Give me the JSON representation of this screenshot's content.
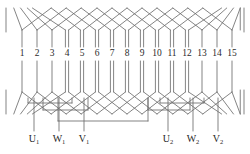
{
  "diagram": {
    "slot_count": 15,
    "slot_numbers": [
      "1",
      "2",
      "3",
      "4",
      "5",
      "6",
      "7",
      "8",
      "9",
      "10",
      "11",
      "12",
      "13",
      "14",
      "15"
    ],
    "line_color": "#6e6e6e",
    "line_color_dark": "#4a4a4a",
    "text_color": "#2b2b2b",
    "background_color": "#ffffff",
    "watermark_color": "#ededed"
  },
  "terminals": {
    "left": [
      {
        "id": "U1",
        "base": "U",
        "sub": "1",
        "x": 34,
        "slot": 1
      },
      {
        "id": "W1",
        "base": "W",
        "sub": "1",
        "x": 59,
        "slot": 3
      },
      {
        "id": "V1",
        "base": "V",
        "sub": "1",
        "x": 84,
        "slot": 5
      }
    ],
    "right": [
      {
        "id": "U2",
        "base": "U",
        "sub": "2",
        "x": 168,
        "slot": 11
      },
      {
        "id": "W2",
        "base": "W",
        "sub": "2",
        "x": 193,
        "slot": 13
      },
      {
        "id": "V2",
        "base": "V",
        "sub": "2",
        "x": 218,
        "slot": 15
      }
    ]
  },
  "geometry": {
    "slot_x": [
      22,
      37,
      52,
      67,
      82,
      97,
      112,
      127,
      142,
      157,
      172,
      187,
      202,
      217,
      232
    ],
    "slot_label_y": 54,
    "bar_top_y": 30,
    "bar_bottom_y": 92,
    "label_gap_top": 47,
    "label_gap_bottom": 61,
    "end_top_peak_y": 8,
    "end_bottom_peak_y": 114,
    "lead_label_y": 140,
    "double_layer_from_slot": 4,
    "double_layer_to_slot": 12,
    "bar_offset": 1.6
  },
  "jumpers": {
    "left_group": [
      {
        "name": "jumper-u-phase",
        "y": 103,
        "x1": 28,
        "x2": 72
      },
      {
        "name": "jumper-w-phase",
        "y": 110,
        "x1": 43,
        "x2": 88
      },
      {
        "name": "jumper-v-phase",
        "y": 121,
        "x1": 58,
        "x2": 148
      }
    ],
    "right_group": [
      {
        "name": "jumper-u2-phase",
        "y": 103,
        "x1": 160,
        "x2": 204
      },
      {
        "name": "jumper-w2-phase",
        "y": 110,
        "x1": 148,
        "x2": 190
      }
    ]
  },
  "watermark": {
    "lines": [
      {
        "text": "",
        "x": 205,
        "y": 14
      },
      {
        "text": "",
        "x": 200,
        "y": 30
      },
      {
        "text": "",
        "x": 210,
        "y": 48
      }
    ]
  }
}
